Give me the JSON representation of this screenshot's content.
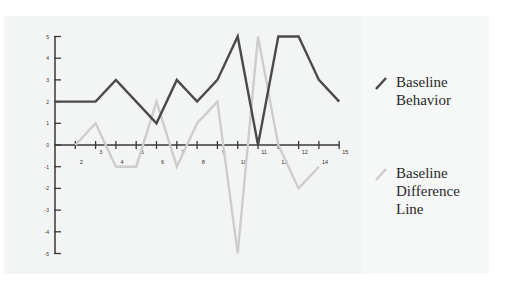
{
  "chart_data": {
    "type": "line",
    "title": "",
    "xlabel": "",
    "ylabel": "",
    "x": [
      0,
      1,
      2,
      3,
      4,
      5,
      6,
      7,
      8,
      9,
      10,
      11,
      12,
      13,
      14
    ],
    "x_tick_labels": [
      {
        "text": "2",
        "row": "lower",
        "pos": 1.3
      },
      {
        "text": "3",
        "row": "upper",
        "pos": 2.25
      },
      {
        "text": "4",
        "row": "lower",
        "pos": 3.3
      },
      {
        "text": "5",
        "row": "upper",
        "pos": 4.3
      },
      {
        "text": "6",
        "row": "lower",
        "pos": 5.3
      },
      {
        "text": "7",
        "row": "upper",
        "pos": 6.3
      },
      {
        "text": "8",
        "row": "lower",
        "pos": 7.3
      },
      {
        "text": "9",
        "row": "upper",
        "pos": 8.3
      },
      {
        "text": "10",
        "row": "lower",
        "pos": 9.3
      },
      {
        "text": "11",
        "row": "upper",
        "pos": 10.3
      },
      {
        "text": "13",
        "row": "lower",
        "pos": 11.3
      },
      {
        "text": "12",
        "row": "upper",
        "pos": 12.3
      },
      {
        "text": "14",
        "row": "lower",
        "pos": 13.3
      },
      {
        "text": "15",
        "row": "upper",
        "pos": 14.3
      }
    ],
    "y_ticks": [
      5,
      4,
      3,
      2,
      1,
      0,
      -1,
      -2,
      -3,
      -4,
      -5
    ],
    "ylim": [
      -5,
      5
    ],
    "xlim": [
      0,
      14
    ],
    "grid": false,
    "legend_position": "right",
    "series": [
      {
        "name": "Baseline Behavior",
        "color": "#4a4a4a",
        "x": [
          0,
          1,
          2,
          3,
          4,
          5,
          6,
          7,
          8,
          9,
          10,
          11,
          12,
          13,
          14
        ],
        "values": [
          2,
          2,
          2,
          3,
          2,
          1,
          3,
          2,
          3,
          5,
          0,
          5,
          5,
          3,
          2
        ]
      },
      {
        "name": "Baseline Difference Line",
        "color": "#cdcdcd",
        "x": [
          1,
          2,
          3,
          4,
          5,
          6,
          7,
          8,
          9,
          10,
          11,
          12,
          13
        ],
        "values": [
          0,
          1,
          -1,
          -1,
          2,
          -1,
          1,
          2,
          -5,
          5,
          0,
          -2,
          -1
        ]
      }
    ]
  },
  "legend": {
    "items": [
      {
        "label": "Baseline\nBehavior",
        "color": "#4a4a4a"
      },
      {
        "label": "Baseline\nDifference\nLine",
        "color": "#cdcdcd"
      }
    ]
  }
}
